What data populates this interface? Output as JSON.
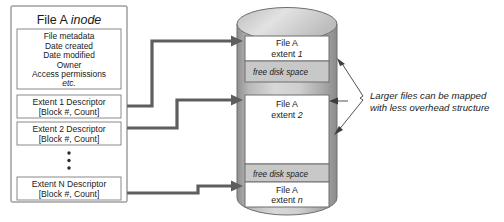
{
  "diagram": {
    "inode": {
      "heading_plain": "File A ",
      "heading_italic": "inode",
      "metadata_lines": [
        "File metadata",
        "Date created",
        "Date modified",
        "Owner",
        "Access permissions"
      ],
      "metadata_etc": "etc.",
      "descriptors": [
        {
          "name": "Extent 1 Descriptor",
          "detail": "[Block #, Count]"
        },
        {
          "name": "Extent 2 Descriptor",
          "detail": "[Block #, Count]"
        },
        {
          "name": "Extent N Descriptor",
          "detail": "[Block #, Count]"
        }
      ],
      "ellipsis": "•"
    },
    "disk": {
      "segments": [
        {
          "kind": "file",
          "line1": "File A",
          "line2_plain": "extent ",
          "line2_italic": "1"
        },
        {
          "kind": "free",
          "label": "free disk space"
        },
        {
          "kind": "file",
          "line1": "File A",
          "line2_plain": "extent ",
          "line2_italic": "2"
        },
        {
          "kind": "free",
          "label": "free disk space"
        },
        {
          "kind": "file",
          "line1": "File A",
          "line2_plain": "extent ",
          "line2_italic": "n"
        }
      ]
    },
    "annotation": {
      "line1": "Larger files can be mapped",
      "line2": "with less overhead structure"
    },
    "colors": {
      "free_space_fill": "#c8c8c8",
      "connector": "#5e5e5e",
      "cylinder_shade": "#b4b4b4",
      "box_stroke": "#6e6e6e",
      "text": "#1a1a1a"
    }
  }
}
